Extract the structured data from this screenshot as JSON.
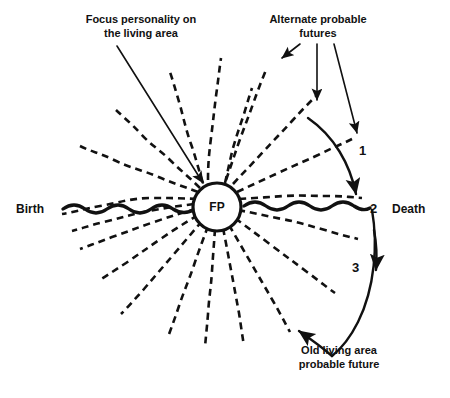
{
  "figure": {
    "center_node": {
      "label": "FP",
      "name": "focus-personality-node"
    },
    "timeline": {
      "start_label": "Birth",
      "end_label": "Death",
      "style": "wavy solid line"
    },
    "annotations": {
      "focus_pointer": {
        "line1": "Focus personality on",
        "line2": "the living area"
      },
      "alternate_futures": {
        "line1": "Alternate probable",
        "line2": "futures"
      },
      "old_living_area": {
        "line1": "Old living area",
        "line2": "probable future"
      }
    },
    "numbered_points": [
      {
        "id": "1",
        "label": "1"
      },
      {
        "id": "2",
        "label": "2"
      },
      {
        "id": "3",
        "label": "3"
      }
    ],
    "colors": {
      "ink": "#111111",
      "background": "#ffffff"
    },
    "ray_count": 20,
    "ray_style": "dashed wavy"
  }
}
